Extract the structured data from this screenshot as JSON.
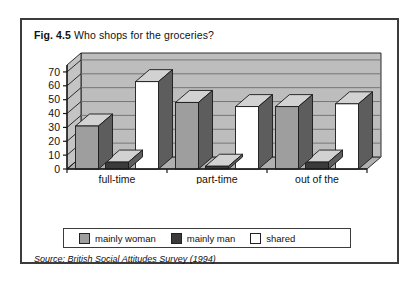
{
  "figure": {
    "number": "Fig. 4.5",
    "title": "Who shops for the groceries?",
    "source_label": "Source:",
    "source_text": "British Social Attitudes Survey (1994)"
  },
  "colors": {
    "mainly_woman": "#9e9e9e",
    "mainly_man": "#3a3a3a",
    "shared": "#ffffff",
    "plot_background": "#bdbdbd",
    "gridline": "#6e6e6e",
    "outline": "#1a1a1a",
    "frame": "#3c3c3c"
  },
  "legend": {
    "items": [
      {
        "label": "mainly woman",
        "swatch": "#9e9e9e"
      },
      {
        "label": "mainly man",
        "swatch": "#3a3a3a"
      },
      {
        "label": "shared",
        "swatch": "#ffffff"
      }
    ]
  },
  "chart_data": {
    "type": "bar",
    "title": "Who shops for the groceries?",
    "xlabel": "",
    "ylabel": "",
    "ylim": [
      0,
      75
    ],
    "yticks": [
      0,
      10,
      20,
      30,
      40,
      50,
      60,
      70
    ],
    "ytick_labels": [
      "0",
      "10",
      "20",
      "30",
      "40",
      "50",
      "60",
      "70"
    ],
    "grid": true,
    "legend_position": "bottom",
    "three_d": true,
    "categories": [
      "full-time",
      "part-time",
      "out of the labour force"
    ],
    "category_lines": [
      [
        "full-time"
      ],
      [
        "part-time"
      ],
      [
        "out of the",
        "labour force"
      ]
    ],
    "series": [
      {
        "name": "mainly woman",
        "values": [
          31,
          48,
          45
        ]
      },
      {
        "name": "mainly man",
        "values": [
          5,
          2,
          5
        ]
      },
      {
        "name": "shared",
        "values": [
          63,
          45,
          47
        ]
      }
    ]
  }
}
